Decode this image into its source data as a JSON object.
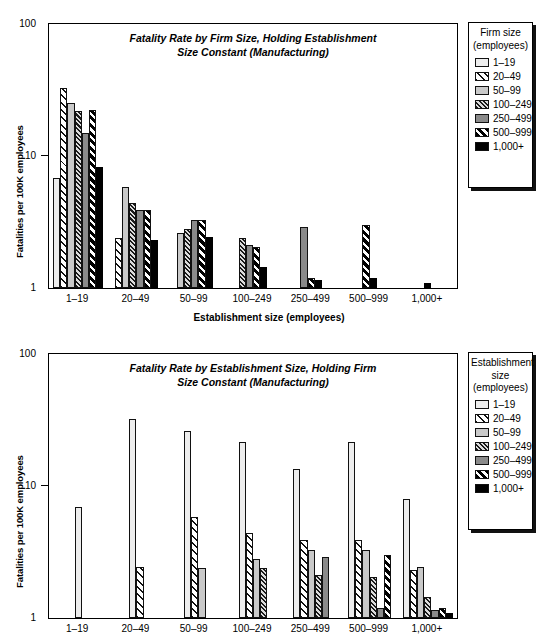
{
  "figure": {
    "series_keys": [
      "1–19",
      "20–49",
      "50–99",
      "100–249",
      "250–499",
      "500–999",
      "1,000+"
    ],
    "y_ticks": [
      "100",
      "10",
      "1"
    ],
    "y_axis_label": "Fatalities per 100K employees"
  },
  "top": {
    "title": "Fatality Rate by Firm Size, Holding Establishment\nSize Constant (Manufacturing)",
    "x_axis_label": "Establishment size (employees)",
    "legend_title": "Firm size\n(employees)",
    "legend_items": [
      "1–19",
      "20–49",
      "50–99",
      "100–249",
      "250–499",
      "500–999",
      "1,000+"
    ]
  },
  "bottom": {
    "title": "Fatality Rate by Establishment Size, Holding Firm\nSize Constant (Manufacturing)",
    "x_axis_label": "",
    "legend_title": "Establishment\nsize\n(employees)",
    "legend_items": [
      "1–19",
      "20–49",
      "50–99",
      "100–249",
      "250–499",
      "500–999",
      "1,000+"
    ]
  },
  "chart_data": [
    {
      "type": "bar",
      "id": "fatality-by-firm-size",
      "title": "Fatality Rate by Firm Size, Holding Establishment Size Constant (Manufacturing)",
      "xlabel": "Establishment size (employees)",
      "ylabel": "Fatalities per 100K employees",
      "yscale": "log",
      "ylim": [
        1,
        100
      ],
      "yticks": [
        1,
        10,
        100
      ],
      "grid": false,
      "legend_position": "right",
      "legend_title": "Firm size (employees)",
      "categories": [
        "1–19",
        "20–49",
        "50–99",
        "100–249",
        "250–499",
        "500–999",
        "1,000+"
      ],
      "series": [
        {
          "name": "1–19",
          "values": [
            6.8,
            null,
            null,
            null,
            null,
            null,
            null
          ]
        },
        {
          "name": "20–49",
          "values": [
            33.0,
            2.4,
            null,
            null,
            null,
            null,
            null
          ]
        },
        {
          "name": "50–99",
          "values": [
            25.0,
            5.8,
            2.6,
            null,
            null,
            null,
            null
          ]
        },
        {
          "name": "100–249",
          "values": [
            22.0,
            4.4,
            2.8,
            2.4,
            null,
            null,
            null
          ]
        },
        {
          "name": "250–499",
          "values": [
            15.0,
            3.9,
            3.3,
            2.1,
            2.9,
            null,
            null
          ]
        },
        {
          "name": "500–999",
          "values": [
            22.5,
            3.9,
            3.3,
            2.05,
            1.2,
            3.0,
            null
          ]
        },
        {
          "name": "1,000+",
          "values": [
            8.3,
            2.3,
            2.45,
            1.45,
            1.15,
            1.2,
            1.1
          ]
        }
      ]
    },
    {
      "type": "bar",
      "id": "fatality-by-establishment-size",
      "title": "Fatality Rate by Establishment Size, Holding Firm Size Constant (Manufacturing)",
      "xlabel": "",
      "ylabel": "Fatalities per 100K employees",
      "yscale": "log",
      "ylim": [
        1,
        100
      ],
      "yticks": [
        1,
        10,
        100
      ],
      "grid": false,
      "legend_position": "right",
      "legend_title": "Establishment size (employees)",
      "categories": [
        "1–19",
        "20–49",
        "50–99",
        "100–249",
        "250–499",
        "500–999",
        "1,000+"
      ],
      "series": [
        {
          "name": "1–19",
          "values": [
            6.9,
            32.0,
            26.0,
            21.5,
            13.5,
            21.5,
            8.0
          ]
        },
        {
          "name": "20–49",
          "values": [
            null,
            2.45,
            5.8,
            4.4,
            3.9,
            3.9,
            2.3
          ]
        },
        {
          "name": "50–99",
          "values": [
            null,
            null,
            2.4,
            2.8,
            3.3,
            3.3,
            2.45
          ]
        },
        {
          "name": "100–249",
          "values": [
            null,
            null,
            null,
            2.4,
            2.1,
            2.05,
            1.45
          ]
        },
        {
          "name": "250–499",
          "values": [
            null,
            null,
            null,
            null,
            2.9,
            1.2,
            1.15
          ]
        },
        {
          "name": "500–999",
          "values": [
            null,
            null,
            null,
            null,
            null,
            3.0,
            1.2
          ]
        },
        {
          "name": "1,000+",
          "values": [
            null,
            null,
            null,
            null,
            null,
            null,
            1.1
          ]
        }
      ]
    }
  ]
}
